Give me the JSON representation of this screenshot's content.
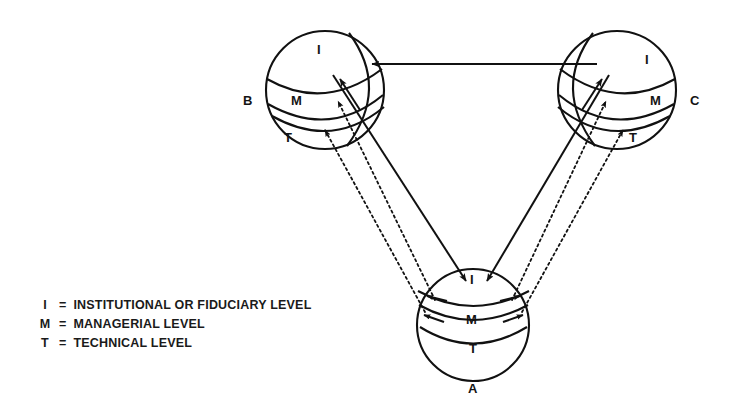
{
  "diagram": {
    "title": "",
    "background_color": "#ffffff",
    "stroke_color": "#111111",
    "spheres": [
      {
        "id": "B",
        "label": "B",
        "label_x": 243,
        "label_y": 93,
        "cx": 325,
        "cy": 90,
        "r": 59,
        "orientation": "tilted-left",
        "levels": [
          {
            "key": "I",
            "label": "I",
            "x": 317,
            "y": 42
          },
          {
            "key": "M",
            "label": "M",
            "x": 291,
            "y": 93
          },
          {
            "key": "T",
            "label": "T",
            "x": 284,
            "y": 130
          }
        ]
      },
      {
        "id": "C",
        "label": "C",
        "label_x": 690,
        "label_y": 93,
        "cx": 617,
        "cy": 90,
        "r": 59,
        "orientation": "tilted-right",
        "levels": [
          {
            "key": "I",
            "label": "I",
            "x": 645,
            "y": 52
          },
          {
            "key": "M",
            "label": "M",
            "x": 650,
            "y": 93
          },
          {
            "key": "T",
            "label": "T",
            "x": 629,
            "y": 130
          }
        ]
      },
      {
        "id": "A",
        "label": "A",
        "label_x": 468,
        "label_y": 381,
        "cx": 473,
        "cy": 325,
        "r": 56,
        "orientation": "upright",
        "levels": [
          {
            "key": "I",
            "label": "I",
            "x": 470,
            "y": 272
          },
          {
            "key": "M",
            "label": "M",
            "x": 466,
            "y": 312
          },
          {
            "key": "T",
            "label": "T",
            "x": 469,
            "y": 341
          }
        ]
      }
    ],
    "connections": [
      {
        "from": "C",
        "to": "B",
        "style": "solid",
        "level": "I",
        "description": "horizontal arrow from sphere C institutional level to sphere B institutional level"
      },
      {
        "from": "B",
        "to": "A",
        "style": "solid",
        "level": "I",
        "description": "solid arrow from sphere B institutional level down to sphere A institutional level"
      },
      {
        "from": "C",
        "to": "A",
        "style": "solid",
        "level": "I",
        "description": "solid arrow from sphere C institutional level down to sphere A institutional level"
      },
      {
        "from": "A",
        "to": "B",
        "style": "dotted",
        "level": "M",
        "description": "dotted arrow from sphere A managerial level up to sphere B managerial level"
      },
      {
        "from": "A",
        "to": "B",
        "style": "dotted",
        "level": "T",
        "description": "dotted arrow from sphere A technical level up to sphere B technical level"
      },
      {
        "from": "A",
        "to": "C",
        "style": "dotted",
        "level": "M",
        "description": "dotted arrow from sphere A managerial level up to sphere C managerial level"
      },
      {
        "from": "A",
        "to": "C",
        "style": "dotted",
        "level": "T",
        "description": "dotted arrow from sphere A technical level up to sphere C technical level"
      }
    ]
  },
  "legend": {
    "items": [
      {
        "key": "I",
        "equals": "=",
        "text": "INSTITUTIONAL OR FIDUCIARY LEVEL"
      },
      {
        "key": "M",
        "equals": "=",
        "text": "MANAGERIAL LEVEL"
      },
      {
        "key": "T",
        "equals": "=",
        "text": "TECHNICAL LEVEL"
      }
    ]
  }
}
